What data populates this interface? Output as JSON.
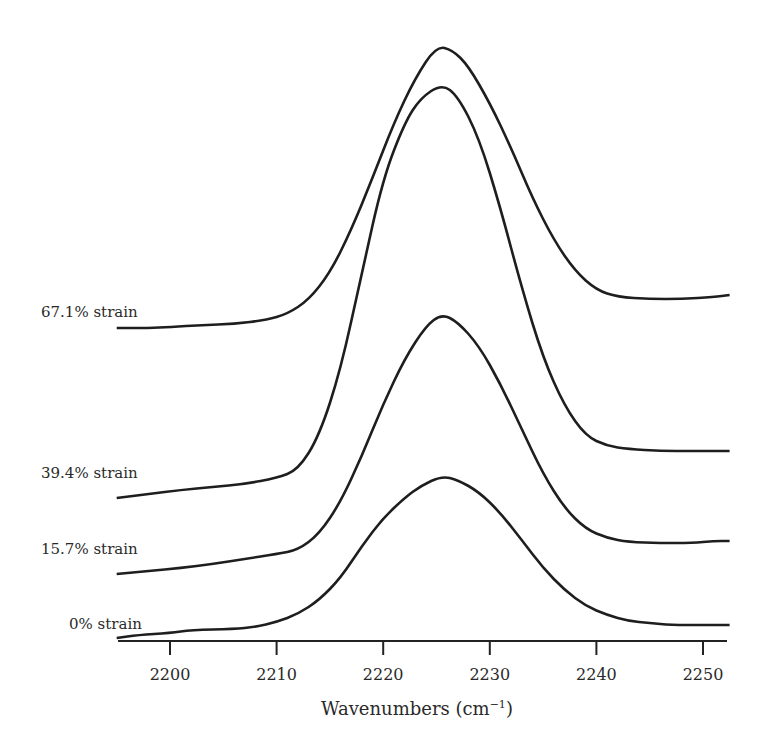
{
  "chart_data": {
    "type": "line",
    "title": "",
    "xlabel": "Wavenumbers (cm⁻¹)",
    "xlabel_base": "Wavenumbers (cm",
    "xlabel_sup": "−1",
    "xlabel_close": ")",
    "ylabel": "",
    "xlim": [
      2195,
      2252.5
    ],
    "x_ticks": [
      2200,
      2210,
      2220,
      2230,
      2240,
      2250
    ],
    "x_tick_labels": [
      "2200",
      "2210",
      "2220",
      "2230",
      "2240",
      "2250"
    ],
    "grid": false,
    "legend_position": "inline-left",
    "stacked_offset": true,
    "series": [
      {
        "name": "0% strain",
        "label": "0% strain",
        "baseline_px": 638,
        "points": [
          [
            2195,
            0
          ],
          [
            2197,
            3
          ],
          [
            2200,
            5
          ],
          [
            2202,
            8
          ],
          [
            2206,
            9
          ],
          [
            2208,
            11
          ],
          [
            2210,
            16
          ],
          [
            2212,
            24
          ],
          [
            2214,
            38
          ],
          [
            2216,
            60
          ],
          [
            2218,
            92
          ],
          [
            2220,
            120
          ],
          [
            2222,
            140
          ],
          [
            2223.5,
            152
          ],
          [
            2225.5,
            162
          ],
          [
            2227,
            158
          ],
          [
            2229,
            146
          ],
          [
            2231,
            125
          ],
          [
            2233,
            98
          ],
          [
            2235,
            70
          ],
          [
            2237,
            48
          ],
          [
            2239,
            32
          ],
          [
            2241,
            23
          ],
          [
            2243,
            17
          ],
          [
            2245,
            15
          ],
          [
            2247,
            13
          ],
          [
            2250,
            13
          ],
          [
            2252.5,
            13
          ]
        ]
      },
      {
        "name": "15.7% strain",
        "label": "15.7% strain",
        "baseline_px": 574,
        "points": [
          [
            2195,
            0
          ],
          [
            2198,
            3
          ],
          [
            2201,
            6
          ],
          [
            2204,
            10
          ],
          [
            2207,
            15
          ],
          [
            2210,
            20
          ],
          [
            2212,
            24
          ],
          [
            2214,
            40
          ],
          [
            2216,
            72
          ],
          [
            2218,
            118
          ],
          [
            2220,
            170
          ],
          [
            2222,
            215
          ],
          [
            2224,
            248
          ],
          [
            2225.5,
            260
          ],
          [
            2227,
            252
          ],
          [
            2229,
            228
          ],
          [
            2231,
            190
          ],
          [
            2233,
            145
          ],
          [
            2235,
            100
          ],
          [
            2237,
            66
          ],
          [
            2239,
            45
          ],
          [
            2241,
            36
          ],
          [
            2243,
            32
          ],
          [
            2246,
            31
          ],
          [
            2249,
            31
          ],
          [
            2251,
            33
          ],
          [
            2252.5,
            33
          ]
        ]
      },
      {
        "name": "39.4% strain",
        "label": "39.4% strain",
        "baseline_px": 498,
        "points": [
          [
            2195,
            0
          ],
          [
            2198,
            4
          ],
          [
            2201,
            8
          ],
          [
            2204,
            11
          ],
          [
            2207,
            14
          ],
          [
            2210,
            20
          ],
          [
            2212,
            28
          ],
          [
            2214,
            62
          ],
          [
            2216,
            128
          ],
          [
            2218,
            225
          ],
          [
            2220,
            320
          ],
          [
            2222,
            375
          ],
          [
            2223.5,
            400
          ],
          [
            2225.5,
            414
          ],
          [
            2227,
            402
          ],
          [
            2229,
            360
          ],
          [
            2231,
            290
          ],
          [
            2233,
            210
          ],
          [
            2235,
            140
          ],
          [
            2237,
            92
          ],
          [
            2239,
            62
          ],
          [
            2241,
            52
          ],
          [
            2243,
            49
          ],
          [
            2246,
            47
          ],
          [
            2249,
            47
          ],
          [
            2252.5,
            47
          ]
        ]
      },
      {
        "name": "67.1% strain",
        "label": "67.1% strain",
        "baseline_px": 328,
        "points": [
          [
            2195,
            0
          ],
          [
            2198,
            0
          ],
          [
            2200,
            1
          ],
          [
            2203,
            3
          ],
          [
            2206,
            4
          ],
          [
            2209,
            8
          ],
          [
            2211,
            14
          ],
          [
            2213,
            28
          ],
          [
            2215,
            55
          ],
          [
            2217,
            98
          ],
          [
            2219,
            150
          ],
          [
            2221,
            205
          ],
          [
            2223,
            250
          ],
          [
            2225,
            282
          ],
          [
            2226.5,
            278
          ],
          [
            2228,
            262
          ],
          [
            2230,
            225
          ],
          [
            2232,
            180
          ],
          [
            2234,
            130
          ],
          [
            2236,
            88
          ],
          [
            2238,
            57
          ],
          [
            2240,
            38
          ],
          [
            2242,
            31
          ],
          [
            2245,
            29
          ],
          [
            2248,
            29
          ],
          [
            2251,
            31
          ],
          [
            2252.5,
            33
          ]
        ]
      }
    ]
  },
  "labels": {
    "s0": "0% strain",
    "s1": "15.7% strain",
    "s2": "39.4% strain",
    "s3": "67.1% strain"
  },
  "style": {
    "line_color": "#1e1e1e",
    "axis_color": "#222222",
    "text_color": "#2a2a2a"
  }
}
